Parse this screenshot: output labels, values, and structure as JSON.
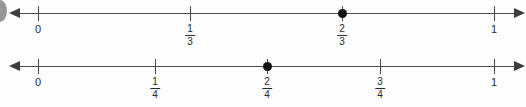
{
  "page": {
    "width": 526,
    "height": 107,
    "background_color": "#fdfdfd",
    "line_color": "#4a4a4a",
    "point_color": "#111111"
  },
  "artifact": {
    "name": "cut-off-bullet-mark"
  },
  "chart_data": {
    "type": "number-line",
    "title": "",
    "lines": [
      {
        "id": "number-line-thirds",
        "denominator": 3,
        "axis_y": 13,
        "x_start": 20,
        "x_end": 515,
        "zero_x": 38,
        "one_x": 494,
        "xlim": [
          0,
          1
        ],
        "ticks": [
          {
            "value": 0,
            "x": 38,
            "label_kind": "whole",
            "whole": "0"
          },
          {
            "value": 0.3333,
            "x": 190,
            "label_kind": "fraction",
            "numerator": "1",
            "denominator": "3"
          },
          {
            "value": 0.6667,
            "x": 342,
            "label_kind": "fraction",
            "numerator": "2",
            "denominator": "3"
          },
          {
            "value": 1,
            "x": 494,
            "label_kind": "whole",
            "whole": "1"
          }
        ],
        "plotted_points": [
          {
            "value": 0.6667,
            "x": 342,
            "label": "2/3"
          }
        ]
      },
      {
        "id": "number-line-fourths",
        "denominator": 4,
        "axis_y": 66,
        "x_start": 20,
        "x_end": 515,
        "zero_x": 38,
        "one_x": 494,
        "xlim": [
          0,
          1
        ],
        "ticks": [
          {
            "value": 0,
            "x": 38,
            "label_kind": "whole",
            "whole": "0"
          },
          {
            "value": 0.25,
            "x": 155,
            "label_kind": "fraction",
            "numerator": "1",
            "denominator": "4"
          },
          {
            "value": 0.5,
            "x": 267,
            "label_kind": "fraction",
            "numerator": "2",
            "denominator": "4"
          },
          {
            "value": 0.75,
            "x": 380,
            "label_kind": "fraction",
            "numerator": "3",
            "denominator": "4"
          },
          {
            "value": 1,
            "x": 494,
            "label_kind": "whole",
            "whole": "1"
          }
        ],
        "plotted_points": [
          {
            "value": 0.5,
            "x": 267,
            "label": "2/4"
          }
        ]
      }
    ]
  }
}
